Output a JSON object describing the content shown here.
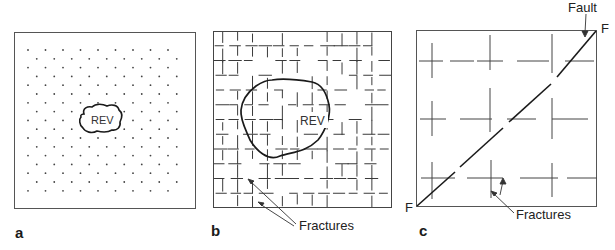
{
  "figure": {
    "panels": [
      {
        "id": "a",
        "label": "a",
        "description": "Porous medium represented by a regular lattice of points with a small REV",
        "box": {
          "x": 14,
          "y": 32,
          "w": 182,
          "h": 177
        },
        "rev_label": "REV",
        "dots": {
          "cols": 9,
          "rows": 17,
          "x0": 28,
          "y0": 50,
          "dx": 17.5,
          "dy": 8.8,
          "offset": 8.75
        }
      },
      {
        "id": "b",
        "label": "b",
        "description": "Densely fractured rock with a larger REV",
        "box": {
          "x": 213,
          "y": 31,
          "w": 179,
          "h": 177
        },
        "rev_label": "REV",
        "grid": {
          "n": 12,
          "step": 14.9
        },
        "annotation": "Fractures"
      },
      {
        "id": "c",
        "label": "c",
        "description": "Sparsely fractured rock cut by a fault F-F",
        "box": {
          "x": 416,
          "y": 30,
          "w": 181,
          "h": 177
        },
        "fault_label": "Fault",
        "fault_end_label": "F",
        "annotation": "Fractures"
      }
    ]
  },
  "labels": {
    "a": "a",
    "b": "b",
    "c": "c",
    "rev_a": "REV",
    "rev_b": "REV",
    "fractures_b": "Fractures",
    "fractures_c": "Fractures",
    "fault": "Fault",
    "f_top": "F",
    "f_bottom": "F"
  },
  "colors": {
    "line": "#3a3a3a",
    "bold": "#1a1a1a",
    "dot": "#444444"
  }
}
